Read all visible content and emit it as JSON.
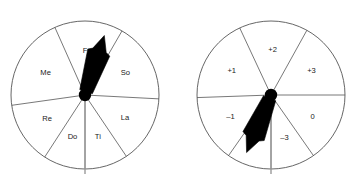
{
  "figure": {
    "title": "",
    "background_color": "#ffffff",
    "stroke_color": "#555555",
    "pointer_color": "#000000",
    "reference_line_color": "#9a9a9a",
    "label_color": "#1a1a1a"
  },
  "wheels": [
    {
      "id": "solfege-wheel",
      "name": "left-spinner",
      "center": {
        "x": 85,
        "y": 95
      },
      "radius": 74,
      "pointer": {
        "angle_deg": 18,
        "label": "spinner-needle"
      },
      "reference_line": {
        "angle_deg": 180
      },
      "sectors": [
        {
          "label": "Fa",
          "start_deg": -24,
          "end_deg": 30,
          "label_r": 44
        },
        {
          "label": "So",
          "start_deg": 30,
          "end_deg": 93,
          "label_r": 46
        },
        {
          "label": "La",
          "start_deg": 93,
          "end_deg": 146,
          "label_r": 46
        },
        {
          "label": "Ti",
          "start_deg": 146,
          "end_deg": 180,
          "label_r": 44
        },
        {
          "label": "Do",
          "start_deg": 180,
          "end_deg": 213,
          "label_r": 44
        },
        {
          "label": "Re",
          "start_deg": 213,
          "end_deg": 262,
          "label_r": 45
        },
        {
          "label": "Me",
          "start_deg": 262,
          "end_deg": 336,
          "label_r": 45
        }
      ]
    },
    {
      "id": "interval-wheel",
      "name": "right-spinner",
      "center": {
        "x": 271,
        "y": 95
      },
      "radius": 74,
      "pointer": {
        "angle_deg": 203,
        "label": "spinner-needle"
      },
      "reference_line": {
        "angle_deg": 180
      },
      "sectors": [
        {
          "label": "+2",
          "start_deg": -25,
          "end_deg": 29,
          "label_r": 45
        },
        {
          "label": "+3",
          "start_deg": 29,
          "end_deg": 90,
          "label_r": 47
        },
        {
          "label": "0",
          "start_deg": 90,
          "end_deg": 145,
          "label_r": 47
        },
        {
          "label": "–3",
          "start_deg": 145,
          "end_deg": 180,
          "label_r": 45
        },
        {
          "label": "–2",
          "start_deg": 180,
          "end_deg": 215,
          "label_r": 45
        },
        {
          "label": "–1",
          "start_deg": 215,
          "end_deg": 268,
          "label_r": 46
        },
        {
          "label": "+1",
          "start_deg": 268,
          "end_deg": 335,
          "label_r": 46
        }
      ]
    }
  ]
}
